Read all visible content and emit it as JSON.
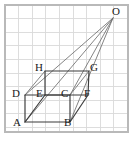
{
  "figure": {
    "canvas": {
      "width": 135,
      "height": 141
    },
    "colors": {
      "background": "#ffffff",
      "grid": "#d9d9d9",
      "grid_border": "#b9b9b9",
      "shape_stroke": "#3a3a3a",
      "ray_stroke": "#6e6e6e",
      "label_text": "#1a1a1a"
    },
    "grid": {
      "visible": true,
      "spacing": 13.6,
      "x_start": 5,
      "y_start": 5,
      "x_end": 128,
      "y_end": 132,
      "columns": 9,
      "rows": 9
    },
    "points": [
      {
        "name": "O",
        "x": 113,
        "y": 18,
        "label": "O",
        "label_x": 112,
        "label_y": 6,
        "label_anchor": "left"
      },
      {
        "name": "H",
        "x": 45,
        "y": 71,
        "label": "H",
        "label_x": 35,
        "label_y": 62,
        "label_anchor": "left"
      },
      {
        "name": "G",
        "x": 89,
        "y": 71,
        "label": "G",
        "label_x": 90,
        "label_y": 62,
        "label_anchor": "left"
      },
      {
        "name": "D",
        "x": 25,
        "y": 95,
        "label": "D",
        "label_x": 12,
        "label_y": 88,
        "label_anchor": "left"
      },
      {
        "name": "E",
        "x": 45,
        "y": 95,
        "label": "E",
        "label_x": 36,
        "label_y": 88,
        "label_anchor": "left"
      },
      {
        "name": "C",
        "x": 70,
        "y": 95,
        "label": "C",
        "label_x": 61,
        "label_y": 88,
        "label_anchor": "left"
      },
      {
        "name": "F",
        "x": 88,
        "y": 95,
        "label": "F",
        "label_x": 84,
        "label_y": 88,
        "label_anchor": "left"
      },
      {
        "name": "A",
        "x": 25,
        "y": 122,
        "label": "A",
        "label_x": 13,
        "label_y": 117,
        "label_anchor": "left"
      },
      {
        "name": "B",
        "x": 70,
        "y": 122,
        "label": "B",
        "label_x": 64,
        "label_y": 117,
        "label_anchor": "left"
      }
    ],
    "shapes": [
      {
        "name": "rectangle-ABCD",
        "vertices": [
          "A",
          "B",
          "C",
          "D"
        ],
        "closed": true,
        "style": "shape-edge"
      },
      {
        "name": "parallelogram-EFGH",
        "vertices": [
          "E",
          "F",
          "G",
          "H"
        ],
        "closed": true,
        "style": "shape-edge"
      }
    ],
    "segments": [
      {
        "name": "segment-AE",
        "from": "A",
        "to": "E",
        "style": "shape-edge"
      },
      {
        "name": "segment-BF",
        "from": "B",
        "to": "F",
        "style": "shape-edge"
      },
      {
        "name": "segment-DH",
        "from": "D",
        "to": "H",
        "style": "ray-line"
      },
      {
        "name": "segment-CG",
        "from": "C",
        "to": "G",
        "style": "ray-line"
      }
    ],
    "rays": [
      {
        "name": "ray-O-to-D",
        "from": "O",
        "to": "D",
        "style": "ray-line"
      },
      {
        "name": "ray-O-to-A",
        "from": "O",
        "to": "A",
        "style": "ray-line"
      },
      {
        "name": "ray-O-to-C",
        "from": "O",
        "to": "C",
        "style": "ray-line"
      },
      {
        "name": "ray-O-to-B",
        "from": "O",
        "to": "B",
        "style": "ray-line"
      }
    ]
  }
}
